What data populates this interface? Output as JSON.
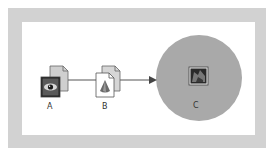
{
  "diagram": {
    "nodes": [
      {
        "id": "A",
        "label": "A",
        "icon": "eye-document-icon"
      },
      {
        "id": "B",
        "label": "B",
        "icon": "bell-document-icon"
      },
      {
        "id": "C",
        "label": "C",
        "icon": "image-thumbnail-icon"
      }
    ],
    "edges": [
      {
        "from": "A",
        "to": "B",
        "style": "line"
      },
      {
        "from": "B",
        "to": "C",
        "style": "arrow"
      }
    ],
    "colors": {
      "frame": "#d2d2d2",
      "panel": "#ffffff",
      "circle": "#a9a9a9",
      "line": "#555555"
    }
  }
}
